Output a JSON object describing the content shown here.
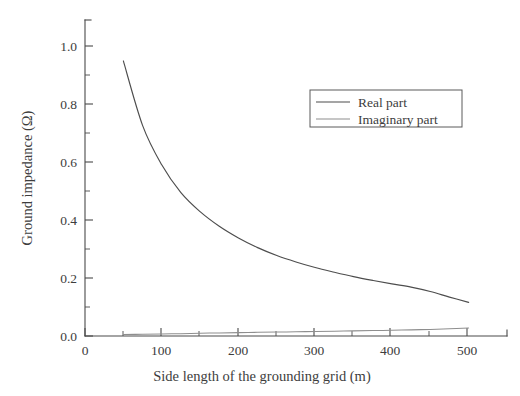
{
  "chart_data": {
    "type": "line",
    "title": "",
    "xlabel": "Side length of the grounding grid (m)",
    "ylabel": "Ground impedance (Ω)",
    "xlim": [
      0,
      550
    ],
    "ylim": [
      0.0,
      1.08
    ],
    "grid": false,
    "legend_position": "upper-right-inside",
    "x_ticks_major": [
      0,
      100,
      200,
      300,
      400,
      500
    ],
    "x_tick_labels": [
      "0",
      "100",
      "200",
      "300",
      "400",
      "500"
    ],
    "x_ticks_minor": [
      50,
      150,
      250,
      350,
      450
    ],
    "y_ticks_major": [
      0.0,
      0.2,
      0.4,
      0.6,
      0.8,
      1.0
    ],
    "y_tick_labels": [
      "0.0",
      "0.2",
      "0.4",
      "0.6",
      "0.8",
      "1.0"
    ],
    "y_ticks_minor": [
      0.1,
      0.3,
      0.5,
      0.7,
      0.9
    ],
    "x": [
      50,
      75,
      100,
      125,
      150,
      175,
      200,
      225,
      250,
      275,
      300,
      325,
      350,
      375,
      400,
      425,
      450,
      475,
      500
    ],
    "series": [
      {
        "name": "Real part",
        "color": "#4d4d4d",
        "values": [
          0.94,
          0.72,
          0.585,
          0.49,
          0.425,
          0.375,
          0.335,
          0.302,
          0.275,
          0.253,
          0.234,
          0.218,
          0.203,
          0.19,
          0.178,
          0.167,
          0.152,
          0.133,
          0.115
        ]
      },
      {
        "name": "Imaginary part",
        "color": "#8e8e8e",
        "values": [
          0.005,
          0.006,
          0.007,
          0.008,
          0.0095,
          0.0105,
          0.0115,
          0.0125,
          0.0135,
          0.0145,
          0.0155,
          0.0165,
          0.0175,
          0.0185,
          0.0195,
          0.021,
          0.0225,
          0.025,
          0.027
        ]
      }
    ]
  },
  "legend": {
    "entries": [
      {
        "label": "Real part"
      },
      {
        "label": "Imaginary part"
      }
    ]
  },
  "axes": {
    "x_title": "Side length of the grounding grid (m)",
    "y_title": "Ground impedance (Ω)"
  }
}
